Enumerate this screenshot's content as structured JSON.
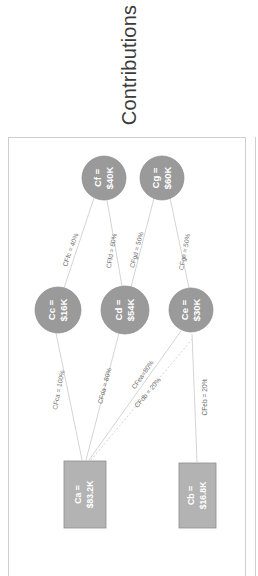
{
  "header": {
    "title": "Contributions"
  },
  "chart_data": {
    "type": "diagram",
    "title": "Contributions",
    "orientation": "rotated-90-ccw",
    "nodes": [
      {
        "id": "Cf",
        "name_label": "Cf =",
        "value_label": "$40K",
        "shape": "circle",
        "tier": "top",
        "cx": 95,
        "cy": 40,
        "r": 22
      },
      {
        "id": "Cg",
        "name_label": "Cg =",
        "value_label": "$60K",
        "shape": "circle",
        "tier": "top",
        "cx": 153,
        "cy": 40,
        "r": 22
      },
      {
        "id": "Cc",
        "name_label": "Cc =",
        "value_label": "$16K",
        "shape": "circle",
        "tier": "middle",
        "cx": 49,
        "cy": 172,
        "r": 23
      },
      {
        "id": "Cd",
        "name_label": "Cd =",
        "value_label": "$54K",
        "shape": "circle",
        "tier": "middle",
        "cx": 116,
        "cy": 172,
        "r": 24
      },
      {
        "id": "Ce",
        "name_label": "Ce =",
        "value_label": "$30K",
        "shape": "circle",
        "tier": "middle",
        "cx": 182,
        "cy": 172,
        "r": 22
      },
      {
        "id": "Ca",
        "name_label": "Ca =",
        "value_label": "$83.2K",
        "shape": "rect",
        "tier": "bottom",
        "x": 55,
        "y": 323,
        "w": 42,
        "h": 67
      },
      {
        "id": "Cb",
        "name_label": "Cb =",
        "value_label": "$16.8K",
        "shape": "rect",
        "tier": "bottom",
        "x": 170,
        "y": 325,
        "w": 37,
        "h": 65
      }
    ],
    "edges": [
      {
        "id": "CFfc",
        "from": "Cf",
        "to": "Cc",
        "label": "CFfc = 40%",
        "percent": 40,
        "style": "solid",
        "x1": 85,
        "y1": 60,
        "x2": 55,
        "y2": 150,
        "lx": 62,
        "ly": 112,
        "rot": -70
      },
      {
        "id": "CFfd",
        "from": "Cf",
        "to": "Cd",
        "label": "CFfd = 60%",
        "percent": 60,
        "style": "solid",
        "x1": 98,
        "y1": 62,
        "x2": 113,
        "y2": 148,
        "lx": 103,
        "ly": 113,
        "rot": -80
      },
      {
        "id": "CFgd",
        "from": "Cg",
        "to": "Cd",
        "label": "CFgd = 50%",
        "percent": 50,
        "style": "solid",
        "x1": 145,
        "y1": 60,
        "x2": 122,
        "y2": 149,
        "lx": 128,
        "ly": 112,
        "rot": -75
      },
      {
        "id": "CFge",
        "from": "Cg",
        "to": "Ce",
        "label": "CFge = 50%",
        "percent": 50,
        "style": "solid",
        "x1": 161,
        "y1": 60,
        "x2": 180,
        "y2": 150,
        "lx": 176,
        "ly": 114,
        "rot": -79
      },
      {
        "id": "CFca",
        "from": "Cc",
        "to": "Ca",
        "label": "CFca = 100%",
        "percent": 100,
        "style": "solid",
        "x1": 47,
        "y1": 195,
        "x2": 73,
        "y2": 322,
        "lx": 50,
        "ly": 252,
        "rot": -79
      },
      {
        "id": "CFda",
        "from": "Cd",
        "to": "Ca",
        "label": "CFda = 80%",
        "percent": 80,
        "style": "solid",
        "x1": 110,
        "y1": 195,
        "x2": 77,
        "y2": 322,
        "lx": 96,
        "ly": 248,
        "rot": -75
      },
      {
        "id": "CFea",
        "from": "Ce",
        "to": "Ca",
        "label": "CFea=80%",
        "percent": 80,
        "style": "solid",
        "x1": 172,
        "y1": 193,
        "x2": 80,
        "y2": 322,
        "lx": 134,
        "ly": 237,
        "rot": -55
      },
      {
        "id": "CFdb",
        "from": "Cd",
        "to": "Cb",
        "label": "CFdb = 20%",
        "percent": 20,
        "style": "dashed",
        "x1": 82,
        "y1": 322,
        "x2": 184,
        "y2": 200,
        "lx": 139,
        "ly": 255,
        "rot": -50
      },
      {
        "id": "CFeb",
        "from": "Ce",
        "to": "Cb",
        "label": "CFeb = 20%",
        "percent": 20,
        "style": "solid",
        "x1": 183,
        "y1": 196,
        "x2": 188,
        "y2": 324,
        "lx": 196,
        "ly": 259,
        "rot": -90
      }
    ]
  },
  "colors": {
    "node_circle_fill": "#9a9a9a",
    "node_rect_fill": "#b3b3b3",
    "edge_stroke": "#c9c9c9",
    "panel_border": "#cfcfcf",
    "title_text": "#3b3b3b",
    "node_text": "#ffffff",
    "edge_label_text": "#6e6e6e",
    "background": "#ffffff"
  }
}
